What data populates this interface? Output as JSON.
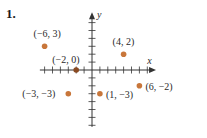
{
  "problem": {
    "number": "1."
  },
  "chart_data": {
    "type": "scatter",
    "title": "",
    "xlabel": "x",
    "ylabel": "y",
    "xlim": [
      -7,
      7
    ],
    "ylim": [
      -7,
      5
    ],
    "grid": false,
    "legend": null,
    "point_color": "#c8763a",
    "points": [
      {
        "x": -6,
        "y": 3,
        "label": "(−6, 3)"
      },
      {
        "x": 4,
        "y": 2,
        "label": "(4, 2)"
      },
      {
        "x": -2,
        "y": 0,
        "label": "(−2, 0)"
      },
      {
        "x": 6,
        "y": -2,
        "label": "(6, −2)"
      },
      {
        "x": -3,
        "y": -3,
        "label": "(−3, −3)"
      },
      {
        "x": 1,
        "y": -3,
        "label": "(1, −3)"
      }
    ]
  }
}
